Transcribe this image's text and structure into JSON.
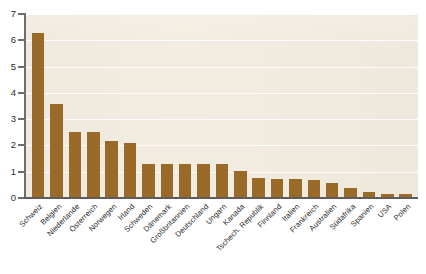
{
  "chart_data": {
    "type": "bar",
    "title": "",
    "subtitle": "",
    "xlabel": "",
    "ylabel": "",
    "ylim": [
      0,
      7
    ],
    "yticks": [
      0,
      1,
      2,
      3,
      4,
      5,
      6,
      7
    ],
    "ytick_labels": [
      "0",
      "1",
      "2",
      "3",
      "4",
      "5",
      "6",
      "7"
    ],
    "grid": true,
    "grid_axis": "y",
    "legend": false,
    "legend_position": "none",
    "orientation": "vertical",
    "bar_color": "#9a6b28",
    "plot_background": "#f3ece0",
    "figure_background": "#ffffff",
    "axis_color": "#5d5d5d",
    "gridline_color": "#ffffff",
    "label_rotation": -45,
    "categories": [
      "Schweiz",
      "Belgien",
      "Niederlande",
      "Österreich",
      "Norwegen",
      "Irland",
      "Schweden",
      "Dänemark",
      "Großbritannien",
      "Deutschland",
      "Ungarn",
      "Kanada",
      "Tschech. Republik",
      "Finnland",
      "Italien",
      "Frankreich",
      "Australien",
      "Südafrika",
      "Spanien",
      "USA",
      "Polen"
    ],
    "values": [
      6.25,
      3.55,
      2.47,
      2.47,
      2.13,
      2.05,
      1.27,
      1.25,
      1.25,
      1.25,
      1.25,
      1.0,
      0.72,
      0.7,
      0.68,
      0.65,
      0.55,
      0.35,
      0.18,
      0.13,
      0.12
    ]
  }
}
